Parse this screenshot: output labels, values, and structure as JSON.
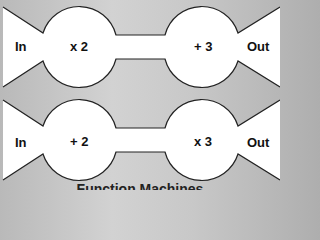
{
  "caption": "Function Machines",
  "machines": [
    {
      "input_label": "In",
      "output_label": "Out",
      "steps": [
        "x 2",
        "+ 3"
      ]
    },
    {
      "input_label": "In",
      "output_label": "Out",
      "steps": [
        "+ 2",
        "x 3"
      ]
    }
  ]
}
